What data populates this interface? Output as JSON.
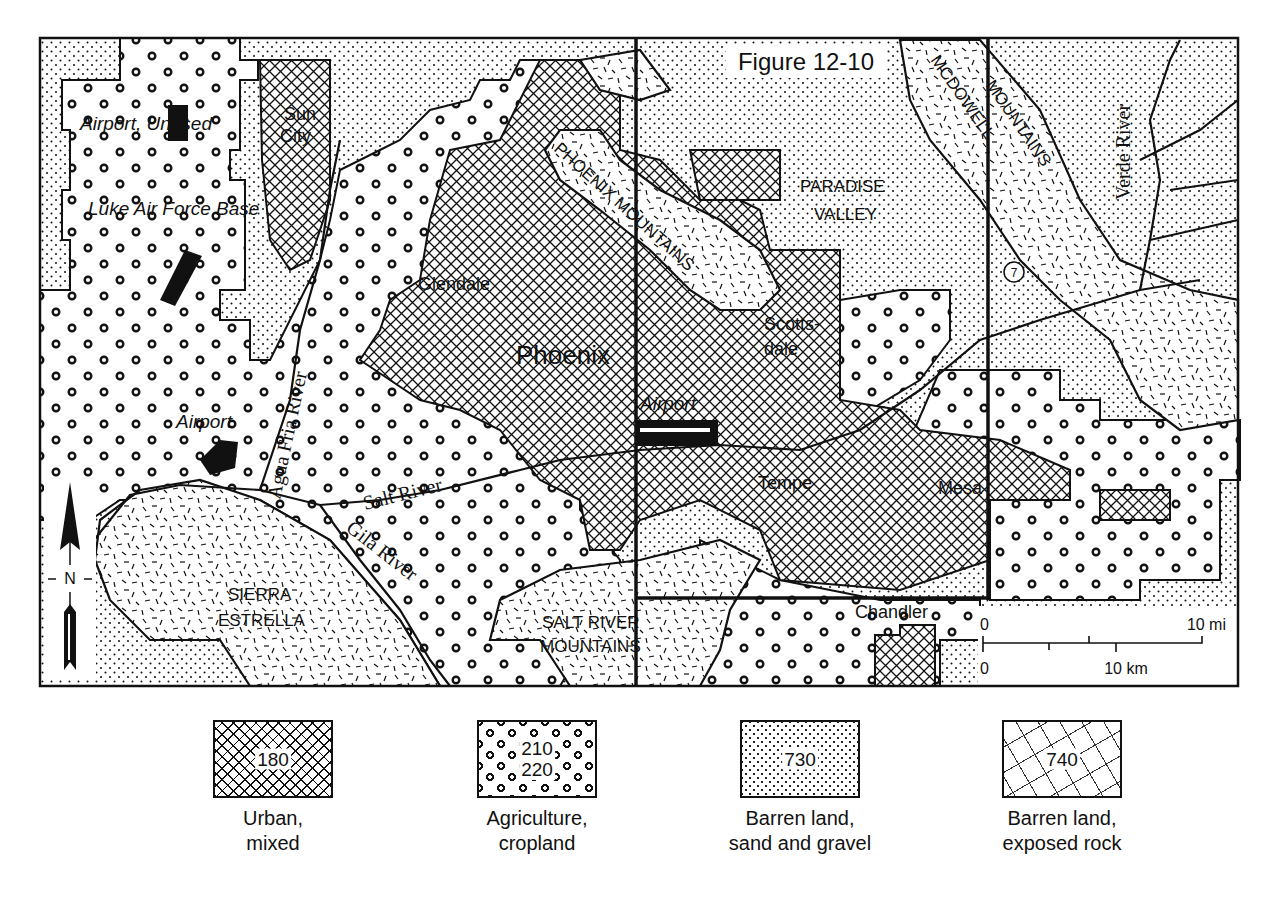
{
  "figure": {
    "title": "Figure 12-10"
  },
  "places": {
    "airport_unused": "Airport, Unused",
    "luke": "Luke Air Force Base",
    "sun_city_1": "Sun",
    "sun_city_2": "City",
    "glendale": "Glendale",
    "phoenix": "Phoenix",
    "airport_west": "Airport",
    "airport_sky_harbor": "Airport",
    "scottsdale_1": "Scotts-",
    "scottsdale_2": "dale",
    "tempe": "Tempe",
    "mesa": "Mesa",
    "chandler": "Chandler",
    "paradise_1": "PARADISE",
    "paradise_2": "VALLEY",
    "phoenix_mtns": "PHOENIX MOUNTAINS",
    "mcdowell_1": "MCDOWELL",
    "mcdowell_2": "MOUNTAINS",
    "sierra_1": "SIERRA",
    "sierra_2": "ESTRELLA",
    "srm_1": "SALT RIVER",
    "srm_2": "MOUNTAINS",
    "agua_fria": "Agua Fria River",
    "salt_river": "Salt River",
    "gila_river": "Gila River",
    "verde_river": "Verde River",
    "highway_marker": "7"
  },
  "north_arrow": {
    "label": "N"
  },
  "scale_bar": {
    "mi_zero": "0",
    "mi_label": "10 mi",
    "km_zero": "0",
    "km_label": "10 km"
  },
  "legend": [
    {
      "code": "180",
      "label": "Urban,\nmixed",
      "pattern": "crosshatch"
    },
    {
      "code": "210\n220",
      "label": "Agriculture,\ncropland",
      "pattern": "dotted-rings"
    },
    {
      "code": "730",
      "label": "Barren land,\nsand and gravel",
      "pattern": "stipple"
    },
    {
      "code": "740",
      "label": "Barren land,\nexposed rock",
      "pattern": "dashes"
    }
  ]
}
